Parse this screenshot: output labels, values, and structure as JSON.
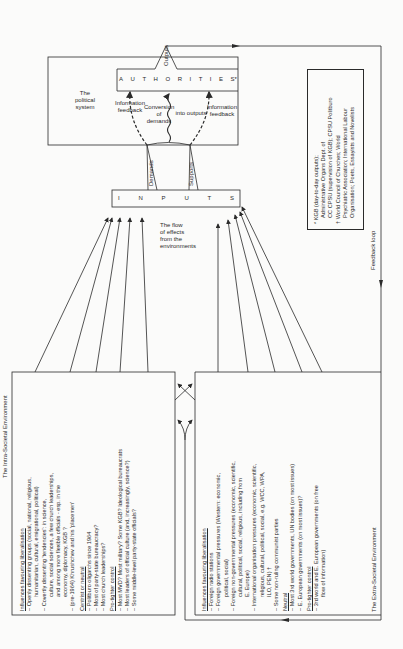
{
  "political_system": {
    "title": [
      "The",
      "political",
      "system"
    ],
    "authorities": [
      "A",
      "U",
      "T",
      "H",
      "O",
      "R",
      "I",
      "T",
      "I",
      "E",
      "S*"
    ],
    "outputs_label": "Outputs",
    "info_feedback_left": [
      "Information",
      "feedback"
    ],
    "conversion": [
      "Conversion",
      "of demands"
    ],
    "into_outputs": "into outputs",
    "info_feedback_right": [
      "Information",
      "feedback"
    ]
  },
  "inputs": {
    "letters": [
      "I",
      "N",
      "P",
      "U",
      "T",
      "S"
    ],
    "demands_label": "Demands",
    "supports_label": "Supports"
  },
  "flow_label": [
    "The flow",
    "of effects",
    "from the",
    "environments"
  ],
  "feedback_loop_label": "Feedback loop",
  "footnotes": {
    "star": [
      "* KGB (day-to-day outputs);",
      "Administrative Organs Dept. of",
      "CC CPSU (supervision of KGB); CPSU Politburo"
    ],
    "dagger": [
      "† World Council of Churches; World",
      "Psychiatric Association; International Labour",
      "Organisation; Poets, Essayists and Novelists"
    ]
  },
  "intra_societal": {
    "title": "The Intra-Societal Environment",
    "sections": [
      {
        "heading": "Influences favouring liberalisation",
        "items": [
          [
            "– Openly dissenting groups (social, national, religious,",
            "humanitarian, cultural, emigrational, political)"
          ],
          [
            "– Covertly dissenting 'tendencies': in science,",
            "culture, social sciences, a few church leaderships,",
            "and among more flexible officials - esp. in the",
            "economy, diplomacy, KGB ?"
          ],
          [
            "– (pre-1964) Khrushchev and his 'placemen'"
          ]
        ]
      },
      {
        "heading": "Centrist or neutral",
        "items": [
          [
            "– Politburo oligarchs since 1964"
          ],
          [
            "– Most of party-state bureaucracy?"
          ],
          [
            "– Most church leaderships?"
          ]
        ]
      },
      {
        "heading": "Pro-tighter control",
        "items": [
          [
            "– Most MVD?  Most military?  Some KGB?  Ideological bureaucrats"
          ],
          [
            "– Most leaders of official culture (and, increasingly, science?)"
          ],
          [
            "– Some middle-level party-state officials?"
          ]
        ]
      }
    ]
  },
  "extra_societal": {
    "title": "The Extra-Societal Environment",
    "sections": [
      {
        "heading": "Influences favouring liberalisation",
        "items": [
          [
            "– Foreign radio stations"
          ],
          [
            "– Foreign governmental pressures (Western: economic,",
            "political, social)"
          ],
          [
            "– Foreign non-governmental pressures (economic, scientific,",
            "cultural, political, social, religious, including from",
            "E. Europe)"
          ],
          [
            "– International organisation pressures (economic, scientific,",
            "religious, cultural, political, social, e.g. WCC, WPA,",
            "ILO, PEN) †"
          ],
          [
            "– Some non-ruling communist parties"
          ]
        ]
      },
      {
        "heading": "Neutral",
        "items": [
          [
            "– Most 3rd world governments, UN bodies (on most issues)"
          ],
          [
            "– E. European governments (on most issues)?"
          ]
        ]
      },
      {
        "heading": "Pro-tighter control",
        "items": [
          [
            "– 3rd world and E. European governments (on free",
            "flow of information)"
          ]
        ]
      }
    ]
  },
  "colors": {
    "ink": "#2a2a2a",
    "paper": "#fbfbfa"
  }
}
